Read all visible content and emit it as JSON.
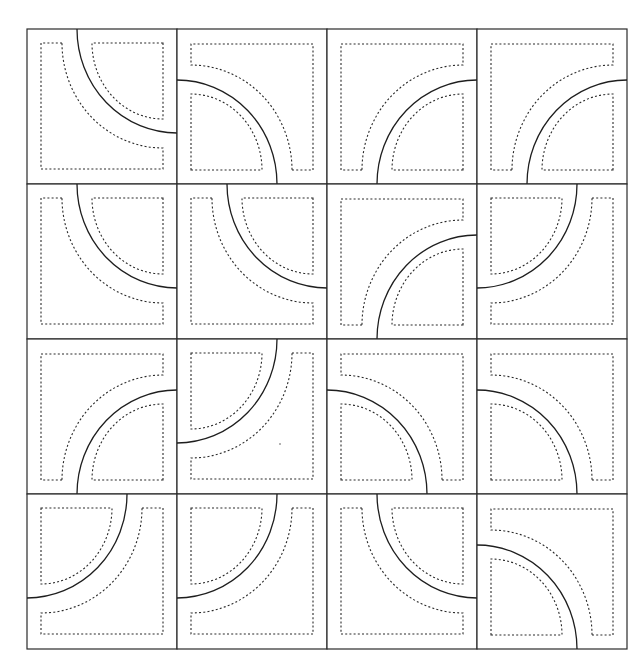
{
  "figure": {
    "type": "quilt-block-pattern",
    "grid": {
      "rows": 4,
      "cols": 4,
      "left": 27,
      "top": 29,
      "tile_width": 150,
      "tile_height": 155
    },
    "colors": {
      "background": "#ffffff",
      "line": "#1e1e1e",
      "dashed": "#2a2a2a"
    },
    "tiles": [
      [
        "TR",
        "BL",
        "BR",
        "BR"
      ],
      [
        "TR",
        "TR",
        "BR",
        "TL"
      ],
      [
        "BR",
        "TL",
        "BL",
        "BL"
      ],
      [
        "TL",
        "TL",
        "TR",
        "BL"
      ]
    ]
  }
}
